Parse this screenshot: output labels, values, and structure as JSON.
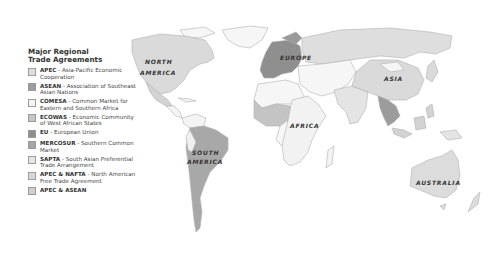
{
  "legend": {
    "title_line1": "Major Regional",
    "title_line2": "Trade Agreements",
    "items": [
      {
        "abbr": "APEC",
        "desc": " - Asia-Pacific Economic Cooperation",
        "color": "#dedede"
      },
      {
        "abbr": "ASEAN",
        "desc": " - Association of Southeast Asian Nations",
        "color": "#9c9c9c"
      },
      {
        "abbr": "COMESA",
        "desc": " - Common Market for Eastern and Southern Africa",
        "color": "#f4f4f4"
      },
      {
        "abbr": "ECOWAS",
        "desc": " - Economic Community of West African States",
        "color": "#c6c6c6"
      },
      {
        "abbr": "EU",
        "desc": " - European Union",
        "color": "#8e8e8e"
      },
      {
        "abbr": "MERCOSUR",
        "desc": " - Southern Common Market",
        "color": "#a6a6a6"
      },
      {
        "abbr": "SAPTA",
        "desc": " - South Asian Preferential Trade Arrangement",
        "color": "#e6e6e6"
      },
      {
        "abbr": "APEC & NAFTA",
        "desc": " - North American Free Trade Agreement",
        "color": "#d9d9d9"
      },
      {
        "abbr": "APEC & ASEAN",
        "desc": "",
        "color": "#cfcfcf"
      }
    ]
  },
  "map": {
    "labels": {
      "north_america": [
        "NORTH",
        "AMERICA"
      ],
      "south_america": [
        "SOUTH",
        "AMERICA"
      ],
      "europe": "EUROPE",
      "africa": "AFRICA",
      "asia": "ASIA",
      "australia": "AUSTRALIA"
    },
    "colors": {
      "ocean": "#ffffff",
      "border": "#b5b5b5",
      "other_land": "#f7f7f7"
    }
  }
}
